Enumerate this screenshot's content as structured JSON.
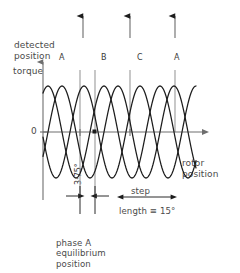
{
  "figure": {
    "title_none": "",
    "detected_position_label": "detected\nposition",
    "y_axis_label": "torque",
    "y_zero_label": "0",
    "x_axis_label": "rotor\nposition",
    "phase_a_equilibrium_label": "phase A\nequilibrium\nposition",
    "step_label": "step",
    "step_length_label": "length ≡ 15°",
    "phase_offset_label": "3·75°"
  },
  "phase_peak_labels": [
    {
      "name": "A",
      "x": 62
    },
    {
      "name": "B",
      "x": 104
    },
    {
      "name": "C",
      "x": 140
    },
    {
      "name": "A",
      "x": 177
    }
  ],
  "detected_position_arrows": [
    {
      "x": 83,
      "y_top": 13,
      "y_bottom": 38
    },
    {
      "x": 130,
      "y_top": 13,
      "y_bottom": 38
    },
    {
      "x": 175,
      "y_top": 13,
      "y_bottom": 38
    }
  ],
  "reference_lines": [
    {
      "x": 80,
      "y_top": 70,
      "y_bottom": 196
    },
    {
      "x": 95,
      "y_top": 70,
      "y_bottom": 196
    },
    {
      "x": 130,
      "y_top": 70,
      "y_bottom": 132
    },
    {
      "x": 175,
      "y_top": 70,
      "y_bottom": 132
    }
  ],
  "colors": {
    "curve": "#1d1d1d",
    "axis": "#6e6e6e",
    "reference": "#9a9a9a",
    "text": "#4a4a4a",
    "background": "#ffffff"
  },
  "chart_data": {
    "type": "line",
    "xlabel": "rotor position",
    "ylabel": "torque",
    "grid": false,
    "legend": "inline peak labels",
    "x_axis": {
      "pixel_start": 43,
      "pixel_end": 207,
      "zero_line_y": 132
    },
    "y_axis": {
      "pixel_top": 60,
      "pixel_bottom": 200,
      "zero_value": 0
    },
    "annotations": [
      {
        "text": "3·75°",
        "kind": "dimension",
        "from_x": 80,
        "to_x": 95,
        "y": 196
      },
      {
        "text": "step length ≡ 15°",
        "kind": "dimension",
        "from_x": 122,
        "to_x": 172,
        "y": 196
      },
      {
        "text": "phase A equilibrium position",
        "kind": "callout",
        "x": 88,
        "y": 218
      },
      {
        "text": "detected position",
        "kind": "callout",
        "x": 14,
        "y": 19
      }
    ],
    "period_px": 56,
    "amplitude_px": 46,
    "series": [
      {
        "name": "A",
        "phase_deg": 0,
        "peak_x": 62,
        "color": "#1d1d1d"
      },
      {
        "name": "B",
        "phase_deg": 120,
        "peak_x": 104,
        "color": "#1d1d1d"
      },
      {
        "name": "C",
        "phase_deg": 240,
        "peak_x": 140,
        "color": "#1d1d1d"
      }
    ],
    "x": [
      0,
      3.75,
      7.5,
      11.25,
      15,
      18.75,
      22.5,
      26.25,
      30,
      33.75,
      37.5,
      41.25,
      45
    ],
    "values_A": [
      1.0,
      0.79,
      0.31,
      -0.31,
      -0.79,
      -1.0,
      -0.79,
      -0.31,
      0.31,
      0.79,
      1.0,
      0.79,
      0.31
    ],
    "values_B": [
      -0.5,
      -0.99,
      -0.89,
      -0.31,
      0.5,
      0.99,
      0.89,
      0.31,
      -0.5,
      -0.99,
      -0.89,
      -0.31,
      0.5
    ],
    "values_C": [
      -0.5,
      0.21,
      0.58,
      0.62,
      0.29,
      0.01,
      -0.1,
      0.0,
      0.19,
      0.2,
      -0.11,
      -0.48,
      -0.81
    ]
  }
}
